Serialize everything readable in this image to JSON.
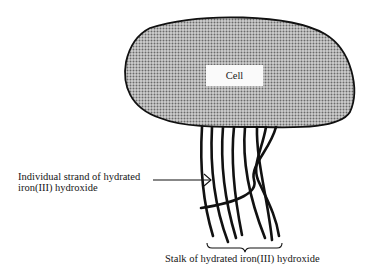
{
  "diagram": {
    "cell": {
      "label": "Cell",
      "fill_pattern": "dotted-stipple",
      "fill_color": "#9a9a9a",
      "outline_color": "#111111"
    },
    "annotations": {
      "strand": {
        "line1": "Individual strand of hydrated",
        "line2": "iron(III) hydroxide"
      },
      "stalk": {
        "label": "Stalk of hydrated iron(III) hydroxide"
      }
    },
    "strand_count": 8
  }
}
